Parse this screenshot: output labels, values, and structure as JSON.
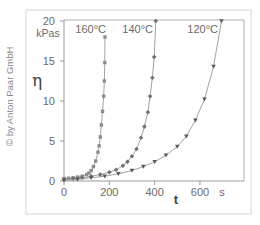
{
  "copyright": "© by Anton Paar GmbH",
  "colors": {
    "frame": "#d6d6d6",
    "axis": "#9a9a9a",
    "text": "#6a6a6a",
    "curve_line": "#8a8a8a",
    "series_160": "#8c8c8c",
    "series_140": "#707070",
    "series_120": "#5a5a5a"
  },
  "chart_data": {
    "type": "scatter",
    "title": "",
    "xlabel": "t",
    "xunit": "s",
    "ylabel": "η",
    "yunit": "kPas",
    "xlim": [
      0,
      790
    ],
    "ylim": [
      0,
      20
    ],
    "xticks": [
      0,
      200,
      400,
      600
    ],
    "yticks": [
      0,
      5,
      10,
      15,
      20
    ],
    "grid": false,
    "legend": "inline labels at top of each curve",
    "series": [
      {
        "name": "160°C",
        "marker": "square",
        "x": [
          0,
          20,
          40,
          60,
          80,
          100,
          110,
          120,
          130,
          140,
          150,
          155,
          160,
          165,
          170,
          175,
          178,
          180,
          181
        ],
        "y": [
          0.3,
          0.35,
          0.4,
          0.5,
          0.6,
          0.8,
          1.0,
          1.3,
          1.8,
          2.5,
          3.6,
          4.4,
          5.5,
          7.0,
          8.7,
          10.6,
          12.5,
          14.8,
          18.0
        ]
      },
      {
        "name": "140°C",
        "marker": "diamond",
        "x": [
          0,
          40,
          80,
          120,
          160,
          200,
          230,
          260,
          280,
          300,
          320,
          340,
          355,
          370,
          380,
          390,
          398,
          405
        ],
        "y": [
          0.2,
          0.3,
          0.4,
          0.6,
          0.8,
          1.1,
          1.4,
          1.9,
          2.4,
          3.1,
          4.0,
          5.4,
          6.8,
          8.6,
          10.6,
          12.9,
          15.5,
          20.0
        ]
      },
      {
        "name": "120°C",
        "marker": "triangle-down",
        "x": [
          0,
          60,
          120,
          180,
          240,
          300,
          350,
          400,
          450,
          500,
          540,
          580,
          620,
          660,
          695
        ],
        "y": [
          0.1,
          0.2,
          0.4,
          0.6,
          0.9,
          1.3,
          1.8,
          2.4,
          3.2,
          4.3,
          5.6,
          7.6,
          10.2,
          14.3,
          20.0
        ]
      }
    ]
  }
}
